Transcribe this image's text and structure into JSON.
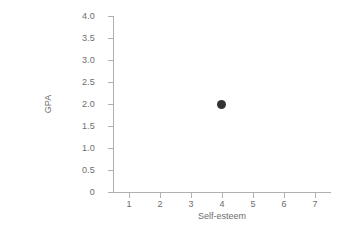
{
  "chart_data": {
    "type": "scatter",
    "title": "",
    "xlabel": "Self-esteem",
    "ylabel": "GPA",
    "xlim": [
      0.5,
      7.5
    ],
    "ylim": [
      0,
      4.0
    ],
    "grid": false,
    "legend": null,
    "x_ticks": [
      1,
      2,
      3,
      4,
      5,
      6,
      7
    ],
    "x_tick_labels": [
      "1",
      "2",
      "3",
      "4",
      "5",
      "6",
      "7"
    ],
    "y_ticks": [
      0,
      0.5,
      1.0,
      1.5,
      2.0,
      2.5,
      3.0,
      3.5,
      4.0
    ],
    "y_tick_labels": [
      "0",
      "0.5",
      "1.0",
      "1.5",
      "2.0",
      "2.5",
      "3.0",
      "3.5",
      "4.0"
    ],
    "points": [
      {
        "x": 4,
        "y": 2.0
      }
    ],
    "marker": {
      "shape": "circle",
      "filled": true,
      "color": "#333333",
      "size_px": 9
    }
  },
  "style": {
    "background": "#ffffff",
    "axis_color": "#b0b0b0",
    "tick_color": "#b0b0b0",
    "label_color": "#6d6d6d",
    "point_color": "#333333"
  },
  "artifact": {
    "clipped_caption": "",
    "faint_text": ""
  }
}
